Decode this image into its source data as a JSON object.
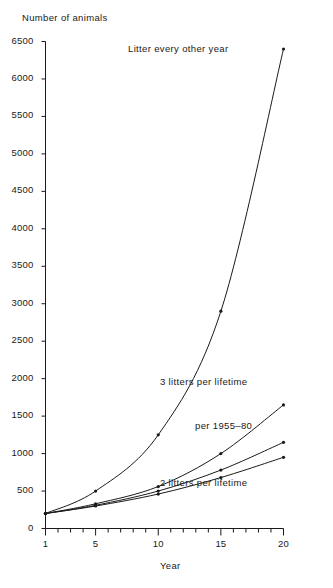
{
  "chart_data": {
    "type": "line",
    "title": "",
    "ylabel": "Number of animals",
    "xlabel": "Year",
    "ylim": [
      0,
      6500
    ],
    "xlim": [
      1,
      20
    ],
    "grid": false,
    "legend_position": "inline-annotations",
    "y_ticks": [
      0,
      500,
      1000,
      1500,
      2000,
      2500,
      3000,
      3500,
      4000,
      4500,
      5000,
      5500,
      6000,
      6500
    ],
    "y_tick_labels": [
      "0",
      "500",
      "1000",
      "1500",
      "2000",
      "2500",
      "3000",
      "3500",
      "4000",
      "4500",
      "5000",
      "5500",
      "6000",
      "6500"
    ],
    "x_ticks_major": [
      1,
      5,
      10,
      15,
      20
    ],
    "x_tick_labels": [
      "1",
      "5",
      "10",
      "15",
      "20"
    ],
    "x_ticks_minor": [
      2,
      3,
      4,
      6,
      7,
      8,
      9,
      11,
      12,
      13,
      14,
      16,
      17,
      18,
      19
    ],
    "x": [
      1,
      5,
      10,
      15,
      20
    ],
    "series": [
      {
        "name": "Litter every other year",
        "label": "Litter every other year",
        "values": [
          200,
          500,
          1250,
          2900,
          6400
        ],
        "label_x": 11.6,
        "label_y": 6400
      },
      {
        "name": "3 litters per lifetime",
        "label": "3 litters per lifetime",
        "values": [
          200,
          330,
          560,
          1000,
          1650
        ],
        "label_x": 13.6,
        "label_y": 1960
      },
      {
        "name": "per 1955-80",
        "label": "per 1955–80",
        "values": [
          200,
          310,
          500,
          780,
          1150
        ],
        "label_x": 15.2,
        "label_y": 1370
      },
      {
        "name": "2 litters per lifetime",
        "label": "2 litters per lifetime",
        "values": [
          200,
          300,
          460,
          680,
          950
        ],
        "label_x": 13.6,
        "label_y": 610
      }
    ],
    "marker": "dot",
    "line_color": "#1a1a1a"
  }
}
